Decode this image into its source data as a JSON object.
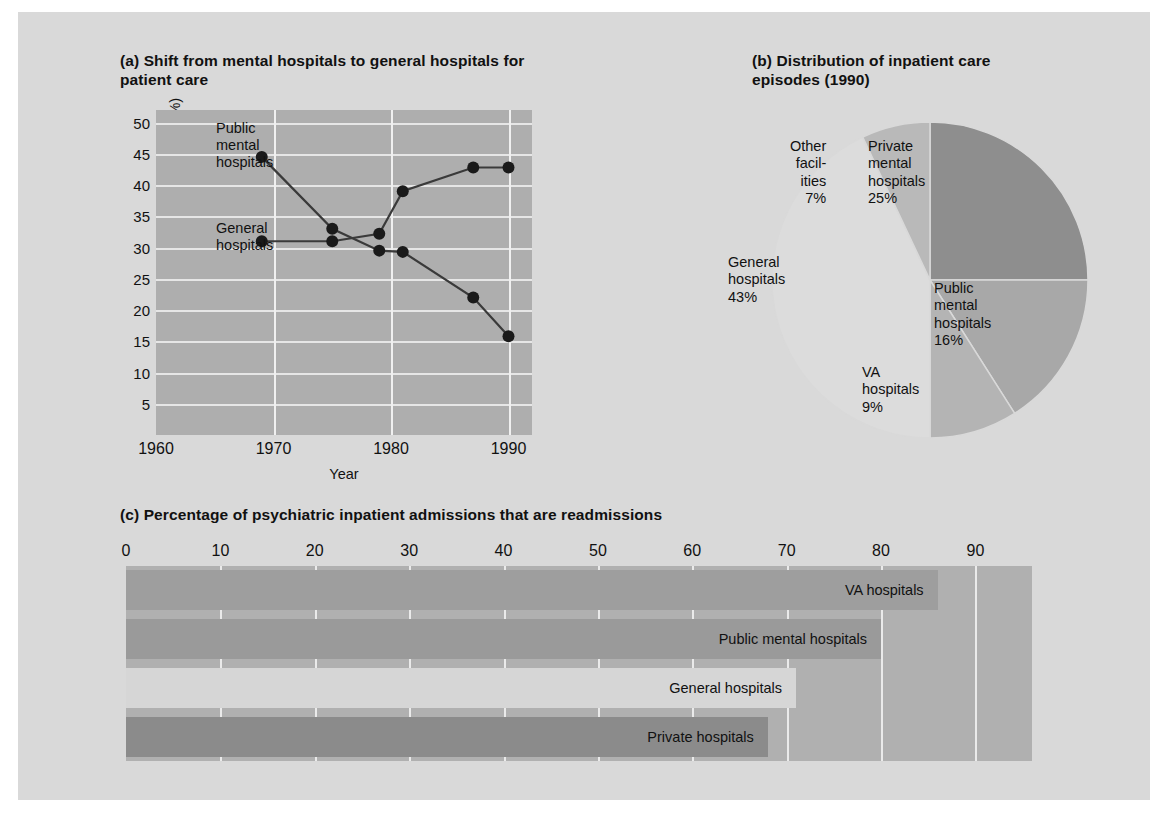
{
  "figure": {
    "background": "#d9d9d9"
  },
  "panel_a": {
    "tag": "(a)",
    "title": "Shift from mental hospitals to general hospitals for patient care",
    "ylabel": "Inpatient episodes (%)",
    "xlabel": "Year",
    "annotation_public": "Public\nmental\nhospitals",
    "annotation_general": "General\nhospitals",
    "annotation_public_lines": [
      "Public",
      "mental",
      "hospitals"
    ],
    "annotation_general_lines": [
      "General",
      "hospitals"
    ]
  },
  "panel_b": {
    "tag": "(b)",
    "title": "Distribution of inpatient care episodes (1990)",
    "labels": {
      "other": [
        "Other",
        "facil-",
        "ities",
        "7%"
      ],
      "private": [
        "Private",
        "mental",
        "hospitals",
        "25%"
      ],
      "public": [
        "Public",
        "mental",
        "hospitals",
        "16%"
      ],
      "va": [
        "VA",
        "hospitals",
        "9%"
      ],
      "general": [
        "General",
        "hospitals",
        "43%"
      ]
    }
  },
  "panel_c": {
    "tag": "(c)",
    "title": "Percentage of psychiatric inpatient admissions that are readmissions",
    "ylabel": "Type of facility"
  },
  "chart_data": [
    {
      "id": "panel-a",
      "type": "line",
      "title": "(a) Shift from mental hospitals to general hospitals for patient care",
      "xlabel": "Year",
      "ylabel": "Inpatient episodes (%)",
      "xlim": [
        1960,
        1992
      ],
      "ylim": [
        0,
        52
      ],
      "xticks": [
        1960,
        1970,
        1980,
        1990
      ],
      "yticks": [
        5,
        10,
        15,
        20,
        25,
        30,
        35,
        40,
        45,
        50
      ],
      "grid": true,
      "legend": "inline-annotations",
      "series": [
        {
          "name": "Public mental hospitals",
          "color": "#3a3a3a",
          "points": [
            {
              "x": 1969,
              "y": 44.5
            },
            {
              "x": 1975,
              "y": 33.0
            },
            {
              "x": 1979,
              "y": 29.5
            },
            {
              "x": 1981,
              "y": 29.3
            },
            {
              "x": 1987,
              "y": 22.0
            },
            {
              "x": 1990,
              "y": 15.8
            }
          ]
        },
        {
          "name": "General hospitals",
          "color": "#3a3a3a",
          "points": [
            {
              "x": 1969,
              "y": 31.0
            },
            {
              "x": 1975,
              "y": 31.0
            },
            {
              "x": 1979,
              "y": 32.2
            },
            {
              "x": 1981,
              "y": 39.0
            },
            {
              "x": 1987,
              "y": 42.8
            },
            {
              "x": 1990,
              "y": 42.8
            }
          ]
        }
      ]
    },
    {
      "id": "panel-b",
      "type": "pie",
      "title": "(b) Distribution of inpatient care episodes (1990)",
      "slices": [
        {
          "label": "Private mental hospitals",
          "value": 25,
          "display": "25%",
          "color": "#8e8e8e"
        },
        {
          "label": "Public mental hospitals",
          "value": 16,
          "display": "16%",
          "color": "#a8a8a8"
        },
        {
          "label": "VA hospitals",
          "value": 9,
          "display": "9%",
          "color": "#b4b4b4"
        },
        {
          "label": "General hospitals",
          "value": 43,
          "display": "43%",
          "color": "#dcdcdc"
        },
        {
          "label": "Other facilities",
          "value": 7,
          "display": "7%",
          "color": "#b9b9b9"
        }
      ]
    },
    {
      "id": "panel-c",
      "type": "bar",
      "orientation": "horizontal",
      "title": "(c) Percentage of psychiatric inpatient admissions that are readmissions",
      "xlabel": "",
      "ylabel": "Type of facility",
      "xlim": [
        0,
        96
      ],
      "xticks": [
        0,
        10,
        20,
        30,
        40,
        50,
        60,
        70,
        80,
        90
      ],
      "grid": true,
      "categories": [
        "VA hospitals",
        "Public mental hospitals",
        "General hospitals",
        "Private hospitals"
      ],
      "values": [
        86,
        80,
        71,
        68
      ],
      "colors": [
        "#9e9e9e",
        "#9a9a9a",
        "#d6d6d6",
        "#8b8b8b"
      ]
    }
  ]
}
